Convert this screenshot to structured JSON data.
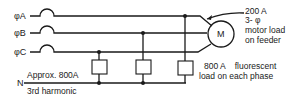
{
  "diagram": {
    "phases": [
      {
        "label": "φA"
      },
      {
        "label": "φB"
      },
      {
        "label": "φC"
      }
    ],
    "neutral": {
      "label": "N",
      "current_label": "Approx. 800A",
      "harmonic_label": "3rd harmonic"
    },
    "motor": {
      "symbol": "M",
      "annotation": [
        "200 A",
        "3- φ",
        "motor load",
        "on feeder"
      ]
    },
    "fluorescent_load": {
      "annotation": [
        "800 A    fluorescent",
        "load on each phase"
      ]
    }
  }
}
